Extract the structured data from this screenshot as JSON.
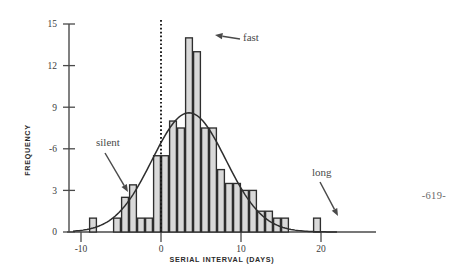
{
  "page": {
    "page_number": "-619-"
  },
  "chart_data": {
    "type": "bar",
    "title": "",
    "xlabel": "SERIAL INTERVAL (DAYS)",
    "ylabel": "FREQUENCY",
    "xlim": [
      -11,
      22
    ],
    "ylim": [
      0,
      15
    ],
    "xticks": [
      -10,
      0,
      10,
      20
    ],
    "xtick_labels": [
      "-10",
      "0",
      "10",
      "20"
    ],
    "yticks": [
      0,
      3,
      6,
      9,
      12,
      15
    ],
    "ytick_labels": [
      "0",
      "3",
      "-6",
      "9",
      "12",
      "15"
    ],
    "grid": false,
    "legend": null,
    "bin_width": 1,
    "bins": [
      {
        "x": -9,
        "value": 1
      },
      {
        "x": -6,
        "value": 1
      },
      {
        "x": -5,
        "value": 2.5
      },
      {
        "x": -4,
        "value": 3.4
      },
      {
        "x": -3,
        "value": 1
      },
      {
        "x": -2,
        "value": 1
      },
      {
        "x": -1,
        "value": 5.5
      },
      {
        "x": 0,
        "value": 5.5
      },
      {
        "x": 1,
        "value": 8
      },
      {
        "x": 2,
        "value": 7.5
      },
      {
        "x": 3,
        "value": 14
      },
      {
        "x": 4,
        "value": 13
      },
      {
        "x": 5,
        "value": 7.5
      },
      {
        "x": 6,
        "value": 7.5
      },
      {
        "x": 7,
        "value": 4.5
      },
      {
        "x": 8,
        "value": 3.5
      },
      {
        "x": 9,
        "value": 3.5
      },
      {
        "x": 10,
        "value": 3
      },
      {
        "x": 11,
        "value": 3
      },
      {
        "x": 12,
        "value": 1.5
      },
      {
        "x": 13,
        "value": 1.5
      },
      {
        "x": 14,
        "value": 1
      },
      {
        "x": 15,
        "value": 1
      },
      {
        "x": 19,
        "value": 1
      }
    ],
    "fit_curve": {
      "name": "normal-fit",
      "mean": 3.5,
      "sd": 4.6,
      "peak": 8.6
    },
    "reference_line": {
      "name": "zero-line",
      "x": 0,
      "style": "dotted"
    },
    "annotations": [
      {
        "label": "silent",
        "text_x": 96,
        "text_y": 146,
        "arrow_from_x": 105,
        "arrow_from_y": 153,
        "arrow_to_x": 128,
        "arrow_to_y": 192
      },
      {
        "label": "fast",
        "text_x": 243,
        "text_y": 41,
        "arrow_from_x": 240,
        "arrow_from_y": 39,
        "arrow_to_x": 215,
        "arrow_to_y": 35
      },
      {
        "label": "long",
        "text_x": 312,
        "text_y": 176,
        "arrow_from_x": 320,
        "arrow_from_y": 182,
        "arrow_to_x": 338,
        "arrow_to_y": 216
      }
    ],
    "colors": {
      "bar_fill": "#d9d9d9",
      "bar_edge": "#2e2e2e",
      "axis": "#4a4a4a",
      "curve": "#2e2e2e",
      "annotation_text": "#4a4a4a"
    }
  }
}
